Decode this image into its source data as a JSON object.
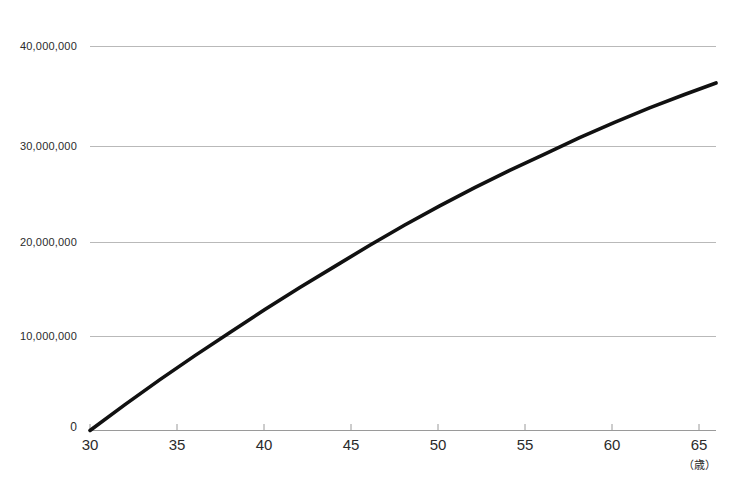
{
  "chart_data": {
    "type": "line",
    "title": "",
    "subtitle": "",
    "xlabel": "（歳）",
    "ylabel": "",
    "grid": true,
    "legend": null,
    "xlim": [
      30,
      65.8
    ],
    "ylim": [
      0,
      40000000
    ],
    "x_ticks": [
      30,
      35,
      40,
      45,
      50,
      55,
      60,
      65
    ],
    "x_tick_labels": [
      "30",
      "35",
      "40",
      "45",
      "50",
      "55",
      "60",
      "65"
    ],
    "y_ticks": [
      0,
      10000000,
      20000000,
      30000000,
      40000000
    ],
    "y_tick_labels": [
      "0",
      "10,000,000",
      "20,000,000",
      "30,000,000",
      "40,000,000"
    ],
    "series": [
      {
        "name": "cumulative-amount",
        "color": "#111111",
        "x": [
          30,
          32,
          34,
          36,
          38,
          40,
          42,
          44,
          46,
          48,
          50,
          52,
          54,
          56,
          58,
          60,
          62,
          64,
          65.8
        ],
        "values": [
          0,
          2700000,
          5300000,
          7800000,
          10200000,
          12600000,
          14900000,
          17100000,
          19300000,
          21400000,
          23400000,
          25300000,
          27100000,
          28800000,
          30500000,
          32100000,
          33600000,
          35000000,
          36200000
        ]
      }
    ],
    "annotations": [
      {
        "text": "curve crosses 10,000,000 near age 38"
      },
      {
        "text": "curve crosses 20,000,000 near age 47"
      },
      {
        "text": "curve crosses 30,000,000 near age 57.5"
      }
    ]
  },
  "colors": {
    "line": "#111111",
    "grid": "#b9b9b9",
    "axis": "#8f8f8f",
    "text": "#2b2b2b",
    "background": "#ffffff"
  }
}
